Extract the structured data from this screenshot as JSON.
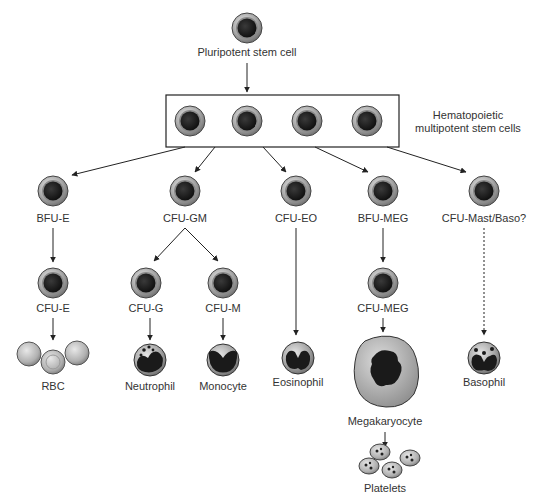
{
  "diagram": {
    "root": {
      "label": "Pluripotent stem cell"
    },
    "multipotent_group": {
      "label_line1": "Hematopoietic",
      "label_line2": "multipotent stem cells"
    },
    "progenitors": [
      {
        "id": "bfu-e",
        "label": "BFU-E"
      },
      {
        "id": "cfu-gm",
        "label": "CFU-GM"
      },
      {
        "id": "cfu-eo",
        "label": "CFU-EO"
      },
      {
        "id": "bfu-meg",
        "label": "BFU-MEG"
      },
      {
        "id": "cfu-mast-baso",
        "label": "CFU-Mast/Baso?"
      }
    ],
    "intermediates": [
      {
        "id": "cfu-e",
        "label": "CFU-E"
      },
      {
        "id": "cfu-g",
        "label": "CFU-G"
      },
      {
        "id": "cfu-m",
        "label": "CFU-M"
      },
      {
        "id": "cfu-meg",
        "label": "CFU-MEG"
      }
    ],
    "mature": [
      {
        "id": "rbc",
        "label": "RBC"
      },
      {
        "id": "neutrophil",
        "label": "Neutrophil"
      },
      {
        "id": "monocyte",
        "label": "Monocyte"
      },
      {
        "id": "eosinophil",
        "label": "Eosinophil"
      },
      {
        "id": "megakaryocyte",
        "label": "Megakaryocyte"
      },
      {
        "id": "basophil",
        "label": "Basophil"
      }
    ],
    "final": {
      "label": "Platelets"
    },
    "colors": {
      "cell_ring": "#9a9a9a",
      "nucleus": "#1e1e1e",
      "line": "#222222"
    }
  }
}
